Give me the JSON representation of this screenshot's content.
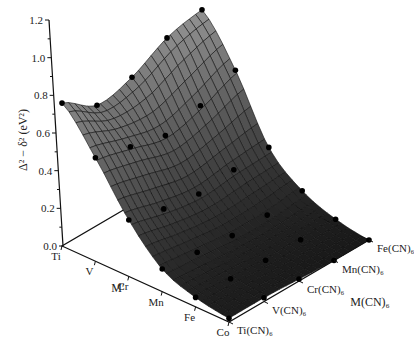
{
  "chart_data": {
    "type": "surface3d",
    "title": "",
    "zlabel": "Δ² − δ² (eV²)",
    "xlabel": "M′",
    "ylabel": "M(CN)₆",
    "x_categories": [
      "Ti",
      "V",
      "Cr",
      "Mn",
      "Fe",
      "Co"
    ],
    "y_categories": [
      "Ti(CN)₆",
      "V(CN)₆",
      "Cr(CN)₆",
      "Mn(CN)₆",
      "Fe(CN)₆"
    ],
    "z_ticks": [
      "0.0",
      "0.2",
      "0.4",
      "0.6",
      "0.8",
      "1.0",
      "1.2"
    ],
    "zlim": [
      0.0,
      1.2
    ],
    "values": [
      [
        0.76,
        0.64,
        0.68,
        0.78,
        0.82
      ],
      [
        0.55,
        0.5,
        0.45,
        0.5,
        0.58
      ],
      [
        0.3,
        0.25,
        0.22,
        0.24,
        0.25
      ],
      [
        0.12,
        0.1,
        0.08,
        0.08,
        0.1
      ],
      [
        0.05,
        0.04,
        0.03,
        0.03,
        0.03
      ],
      [
        0.02,
        0.02,
        0.01,
        0.0,
        0.0
      ]
    ],
    "grid": true,
    "markers": "data points shown as black dots on surface",
    "surface_color": "#6e6e6e"
  }
}
